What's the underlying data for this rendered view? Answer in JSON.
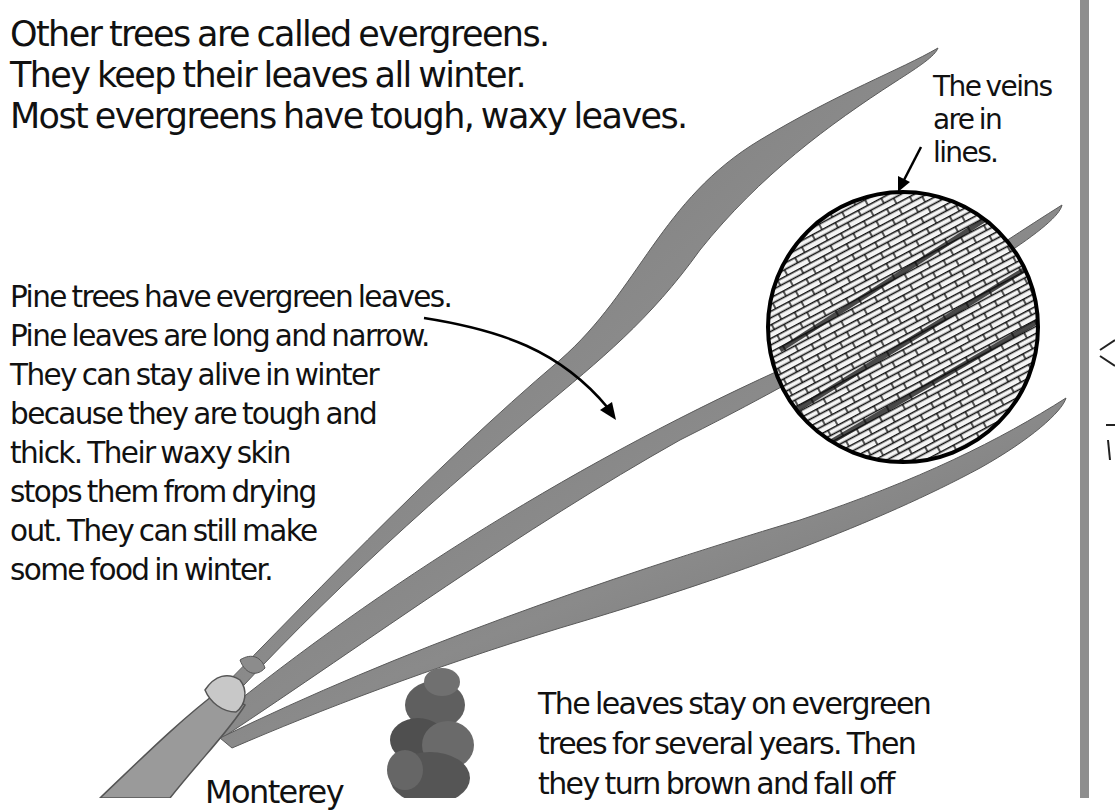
{
  "page": {
    "intro": {
      "lines": [
        "Other trees are called evergreens.",
        "They keep their leaves all winter.",
        "Most evergreens have tough, waxy leaves."
      ]
    },
    "pine_paragraph": {
      "lines": [
        "Pine trees have evergreen leaves.",
        "Pine leaves are long and narrow.",
        "They can stay alive in winter",
        "because they are tough and",
        "thick. Their waxy skin",
        "stops them from drying",
        "out. They can still make",
        "some food in winter."
      ]
    },
    "veins_caption": {
      "lines": [
        "The veins",
        "are in",
        "lines."
      ]
    },
    "leaves_stay_paragraph": {
      "lines": [
        "The leaves stay on evergreen",
        "trees for several years. Then",
        "they turn brown and fall off"
      ]
    },
    "tree_caption": {
      "text": "Monterey"
    },
    "colors": {
      "text": "#111111",
      "needle": "#7a7a7a",
      "needle_dark": "#555555",
      "magnifier_outline": "#000000",
      "page_divider": "#8e8e8e",
      "background": "#ffffff"
    },
    "illustrations": [
      "pine-needle-cluster",
      "magnified-vein-circle",
      "monterey-pine-tree"
    ]
  }
}
